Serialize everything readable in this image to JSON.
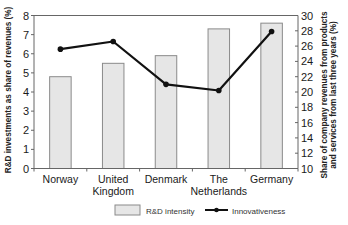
{
  "chart_data": {
    "type": "bar",
    "title": "",
    "categories": [
      "Norway",
      "United Kingdom",
      "Denmark",
      "The Netherlands",
      "Germany"
    ],
    "category_label_lines": [
      [
        "Norway"
      ],
      [
        "United",
        "Kingdom"
      ],
      [
        "Denmark"
      ],
      [
        "The",
        "Netherlands"
      ],
      [
        "Germany"
      ]
    ],
    "series": [
      {
        "name": "R&D intensity",
        "type": "bar",
        "axis": "left",
        "values": [
          4.8,
          5.5,
          5.9,
          7.3,
          7.6
        ],
        "color": "#e6e6e6",
        "stroke": "#8a8a8a"
      },
      {
        "name": "Innovativeness",
        "type": "line",
        "axis": "right",
        "values": [
          25.6,
          26.6,
          21.0,
          20.2,
          27.9
        ],
        "color": "#111111"
      }
    ],
    "xlabel": "",
    "ylabel": "R&D investments as share of revenues (%)",
    "ylabel_right": [
      "Share of company revenues from products",
      "and services from last three years (%)"
    ],
    "ylim": [
      0,
      8
    ],
    "yticks": [
      0,
      1,
      2,
      3,
      4,
      5,
      6,
      7,
      8
    ],
    "ylim_right": [
      10,
      30
    ],
    "yticks_right": [
      10,
      12,
      14,
      16,
      18,
      20,
      22,
      24,
      26,
      28,
      30
    ],
    "grid": false,
    "legend_position": "bottom"
  },
  "legend": {
    "bar_label": "R&D intensity",
    "line_label": "Innovativeness"
  }
}
